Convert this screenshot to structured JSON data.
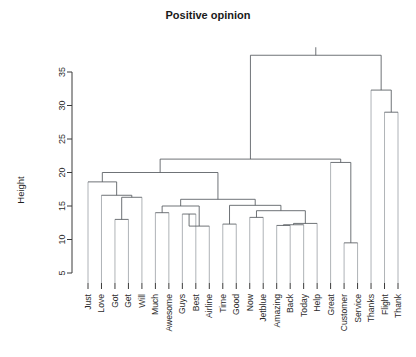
{
  "chart_data": {
    "type": "dendrogram",
    "title": "Positive opinion",
    "xlabel": "",
    "ylabel": "Height",
    "ylim": [
      3,
      38.5
    ],
    "yticks": [
      5,
      10,
      15,
      20,
      25,
      30,
      35
    ],
    "grid": false,
    "legend": "none",
    "leaf_order": [
      "Just",
      "Love",
      "Got",
      "Get",
      "Will",
      "Much",
      "Awesome",
      "Guys",
      "Best",
      "Airline",
      "Time",
      "Good",
      "Now",
      "Jetblue",
      "Amazing",
      "Back",
      "Today",
      "Help",
      "Great",
      "Customer",
      "Service",
      "Thanks",
      "Flight",
      "Thank"
    ],
    "merges": [
      {
        "id": "m1",
        "left": "Got",
        "right": "Get",
        "height": 13.0
      },
      {
        "id": "m2",
        "left": "m1",
        "right": "Will",
        "height": 16.3
      },
      {
        "id": "m3",
        "left": "Love",
        "right": "m2",
        "height": 16.6
      },
      {
        "id": "m4",
        "left": "Just",
        "right": "m3",
        "height": 18.6
      },
      {
        "id": "m5",
        "left": "Much",
        "right": "Awesome",
        "height": 14.0
      },
      {
        "id": "m6",
        "left": "Guys",
        "right": "Best",
        "height": 13.8
      },
      {
        "id": "m7",
        "left": "m6",
        "right": "Airline",
        "height": 12.0
      },
      {
        "id": "m8",
        "left": "m5",
        "right": "m7",
        "height": 15.0
      },
      {
        "id": "m9",
        "left": "Time",
        "right": "Good",
        "height": 12.3
      },
      {
        "id": "m10",
        "left": "Now",
        "right": "Jetblue",
        "height": 13.3
      },
      {
        "id": "m11",
        "left": "Amazing",
        "right": "Back",
        "height": 12.1
      },
      {
        "id": "m12",
        "left": "m11",
        "right": "Today",
        "height": 12.2
      },
      {
        "id": "m13",
        "left": "m12",
        "right": "Help",
        "height": 12.4
      },
      {
        "id": "m14",
        "left": "m10",
        "right": "m13",
        "height": 14.3
      },
      {
        "id": "m15",
        "left": "m9",
        "right": "m14",
        "height": 15.1
      },
      {
        "id": "m16",
        "left": "m8",
        "right": "m15",
        "height": 16.0
      },
      {
        "id": "m17",
        "left": "m4",
        "right": "m16",
        "height": 20.0
      },
      {
        "id": "m18",
        "left": "Customer",
        "right": "Service",
        "height": 9.5
      },
      {
        "id": "m19",
        "left": "Great",
        "right": "m18",
        "height": 21.5
      },
      {
        "id": "m20",
        "left": "m17",
        "right": "m19",
        "height": 22.0
      },
      {
        "id": "m21",
        "left": "Flight",
        "right": "Thank",
        "height": 29.0
      },
      {
        "id": "m22",
        "left": "Thanks",
        "right": "m21",
        "height": 32.3
      },
      {
        "id": "m23",
        "left": "m20",
        "right": "m22",
        "height": 37.5
      }
    ]
  },
  "axis": {
    "tick_labels": [
      "5",
      "10",
      "15",
      "20",
      "25",
      "30",
      "35"
    ]
  },
  "colors": {
    "branch": "#555a5e",
    "stem": "#9aa0a4",
    "axis": "#3a3a3a",
    "text": "#2b2b2b",
    "background": "#ffffff"
  }
}
